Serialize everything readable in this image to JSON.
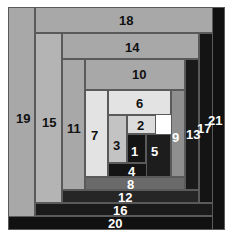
{
  "figure": {
    "width": 233,
    "height": 244,
    "background": "#ffffff",
    "stroke": "#5a5a5a"
  },
  "palette": {
    "light": "#e3e3e3",
    "light2": "#dcdcdc",
    "mid_light": "#c3c3c3",
    "mid": "#a8a8a8",
    "mid_dark": "#8f8f8f",
    "gray": "#7d7d7d",
    "dark_gray": "#5f5f5f",
    "dark": "#3a3a3a",
    "darker": "#262626",
    "near_black": "#141414",
    "black": "#0d0d0d"
  },
  "chart_data": {
    "type": "table",
    "xlabel": "",
    "ylabel": "",
    "legend": [],
    "pieces": [
      {
        "n": 1,
        "label": "1",
        "x": 127,
        "y": 134,
        "w": 19,
        "h": 29,
        "fill": "#141414",
        "text": "#ffffff"
      },
      {
        "n": 2,
        "label": "2",
        "x": 127,
        "y": 115,
        "w": 29,
        "h": 19,
        "fill": "#dcdcdc",
        "text": "#111111"
      },
      {
        "n": 3,
        "label": "3",
        "x": 108,
        "y": 115,
        "w": 19,
        "h": 48,
        "fill": "#c3c3c3",
        "text": "#111111"
      },
      {
        "n": 4,
        "label": "4",
        "x": 108,
        "y": 163,
        "w": 48,
        "h": 14,
        "fill": "#141414",
        "text": "#ffffff"
      },
      {
        "n": 5,
        "label": "5",
        "x": 146,
        "y": 134,
        "w": 25,
        "h": 43,
        "fill": "#1d1d1d",
        "text": "#ffffff"
      },
      {
        "n": 6,
        "label": "6",
        "x": 108,
        "y": 90,
        "w": 63,
        "h": 25,
        "fill": "#e3e3e3",
        "text": "#111111"
      },
      {
        "n": 7,
        "label": "7",
        "x": 85,
        "y": 90,
        "w": 23,
        "h": 87,
        "fill": "#e3e3e3",
        "text": "#111111"
      },
      {
        "n": 8,
        "label": "8",
        "x": 85,
        "y": 177,
        "w": 100,
        "h": 13,
        "fill": "#6a6a6a",
        "text": "#ffffff"
      },
      {
        "n": 9,
        "label": "9",
        "x": 171,
        "y": 90,
        "w": 14,
        "h": 87,
        "fill": "#8f8f8f",
        "text": "#ffffff"
      },
      {
        "n": 10,
        "label": "10",
        "x": 85,
        "y": 59,
        "w": 100,
        "h": 31,
        "fill": "#a8a8a8",
        "text": "#111111"
      },
      {
        "n": 11,
        "label": "11",
        "x": 62,
        "y": 59,
        "w": 23,
        "h": 131,
        "fill": "#a8a8a8",
        "text": "#111111"
      },
      {
        "n": 12,
        "label": "12",
        "x": 62,
        "y": 190,
        "w": 137,
        "h": 13,
        "fill": "#262626",
        "text": "#ffffff"
      },
      {
        "n": 13,
        "label": "13",
        "x": 185,
        "y": 59,
        "w": 14,
        "h": 131,
        "fill": "#1a1a1a",
        "text": "#ffffff"
      },
      {
        "n": 14,
        "label": "14",
        "x": 62,
        "y": 33,
        "w": 137,
        "h": 26,
        "fill": "#a8a8a8",
        "text": "#111111"
      },
      {
        "n": 15,
        "label": "15",
        "x": 35,
        "y": 33,
        "w": 27,
        "h": 170,
        "fill": "#b4b4b4",
        "text": "#111111"
      },
      {
        "n": 16,
        "label": "16",
        "x": 35,
        "y": 203,
        "w": 178,
        "h": 13,
        "fill": "#1a1a1a",
        "text": "#ffffff"
      },
      {
        "n": 17,
        "label": "17",
        "x": 199,
        "y": 33,
        "w": 14,
        "h": 170,
        "fill": "#141414",
        "text": "#ffffff"
      },
      {
        "n": 18,
        "label": "18",
        "x": 35,
        "y": 7,
        "w": 178,
        "h": 26,
        "fill": "#a8a8a8",
        "text": "#111111"
      },
      {
        "n": 19,
        "label": "19",
        "x": 8,
        "y": 7,
        "w": 27,
        "h": 223,
        "fill": "#a8a8a8",
        "text": "#111111"
      },
      {
        "n": 20,
        "label": "20",
        "x": 8,
        "y": 216,
        "w": 217,
        "h": 14,
        "fill": "#111111",
        "text": "#ffffff"
      },
      {
        "n": 21,
        "label": "21",
        "x": 212,
        "y": 7,
        "w": 13,
        "h": 223,
        "fill": "#111111",
        "text": "#ffffff"
      }
    ],
    "label_overrides": {
      "9": {
        "lx": 172,
        "ly": 131
      },
      "13": {
        "lx": 186,
        "ly": 128
      },
      "17": {
        "lx": 197,
        "ly": 122
      },
      "21": {
        "lx": 208,
        "ly": 114
      },
      "5": {
        "lx": 151,
        "ly": 145
      },
      "1": {
        "lx": 131,
        "ly": 145
      },
      "4": {
        "lx": 128,
        "ly": 165
      },
      "8": {
        "lx": 127,
        "ly": 178
      },
      "12": {
        "lx": 118,
        "ly": 191
      },
      "16": {
        "lx": 113,
        "ly": 204
      },
      "20": {
        "lx": 108,
        "ly": 217
      },
      "19": {
        "lx": 16,
        "ly": 112
      },
      "15": {
        "lx": 42,
        "ly": 116
      },
      "11": {
        "lx": 67,
        "ly": 122
      },
      "7": {
        "lx": 91,
        "ly": 129
      },
      "3": {
        "lx": 113,
        "ly": 139
      },
      "2": {
        "lx": 137,
        "ly": 119
      },
      "6": {
        "lx": 136,
        "ly": 97
      },
      "10": {
        "lx": 132,
        "ly": 68
      },
      "14": {
        "lx": 125,
        "ly": 41
      },
      "18": {
        "lx": 119,
        "ly": 14
      }
    }
  }
}
